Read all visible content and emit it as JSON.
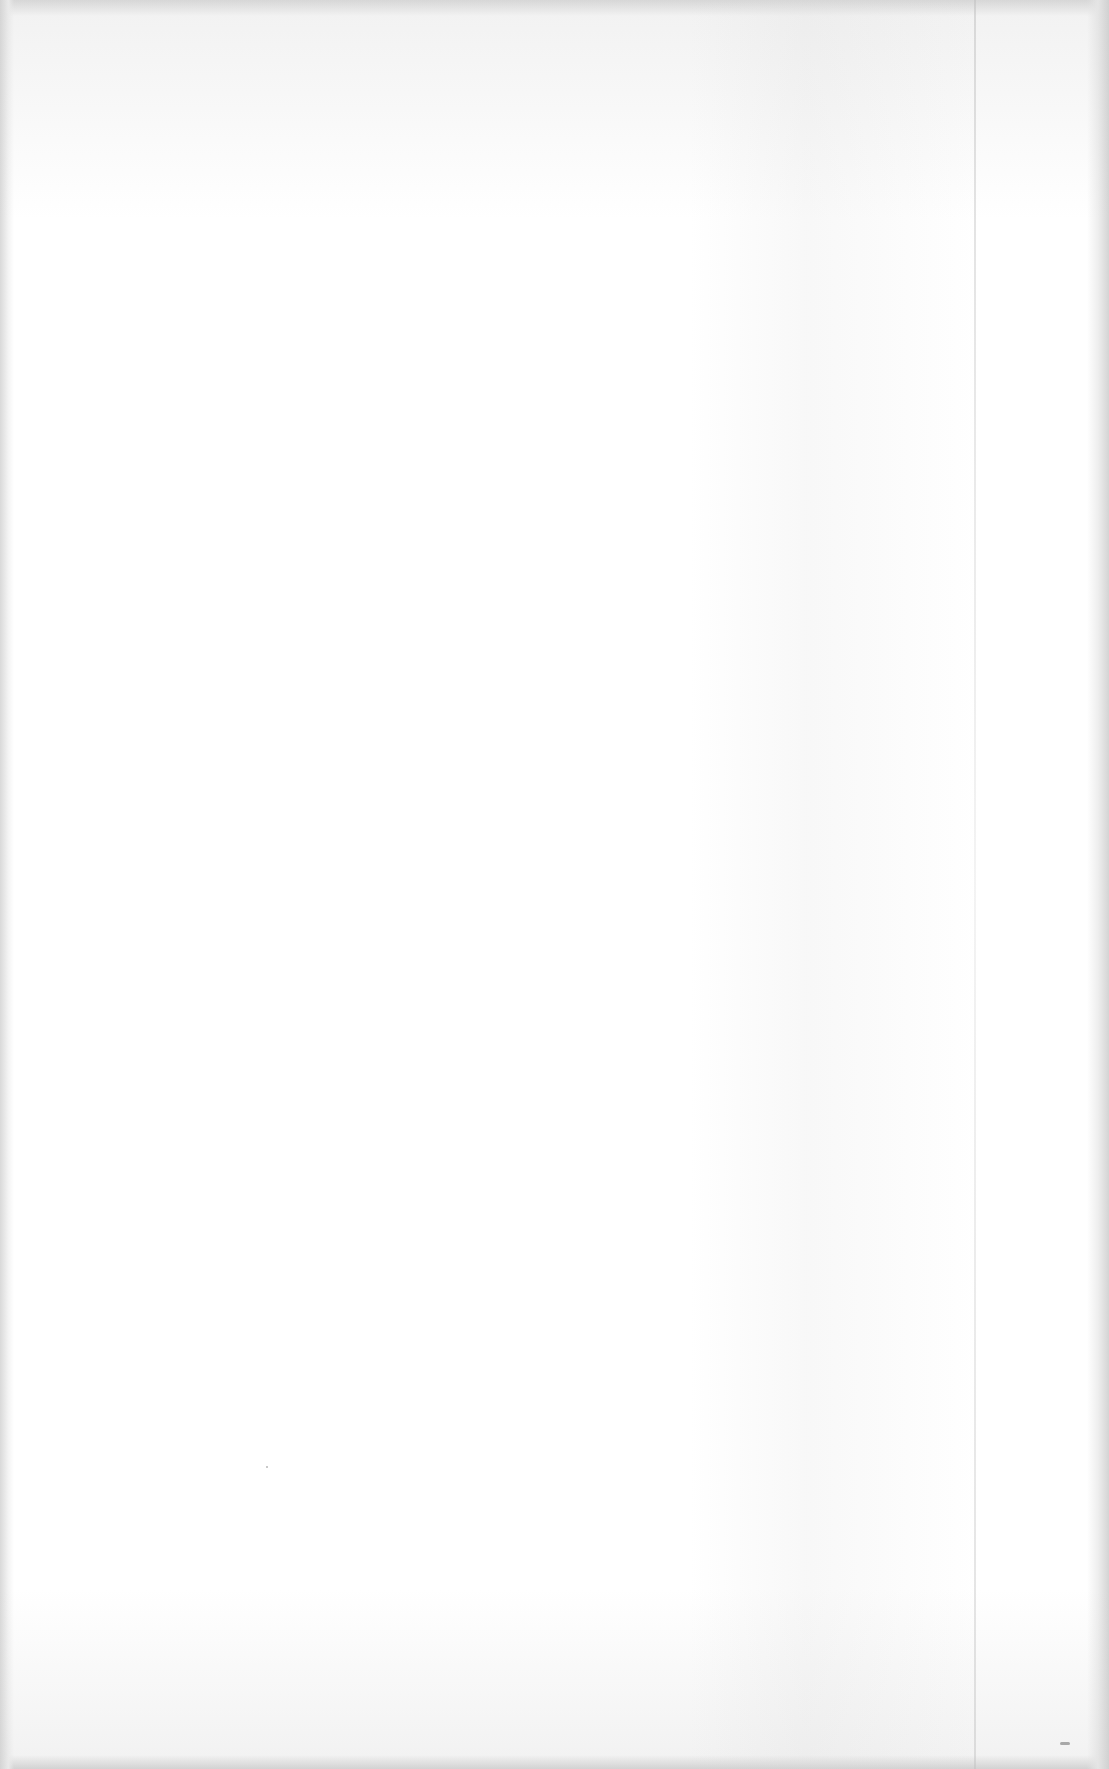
{
  "document": {
    "type": "scanned-page",
    "content": "",
    "blank": true
  },
  "colors": {
    "paper": "#ffffff",
    "scan_edge": "#d6d6d6"
  }
}
